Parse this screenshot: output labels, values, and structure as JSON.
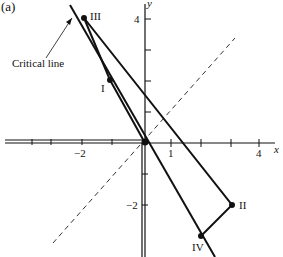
{
  "panel_label": "(a)",
  "axes": {
    "x_label": "x",
    "y_label": "y",
    "x_ticks": [
      {
        "v": -2,
        "label": "−2"
      },
      {
        "v": 1,
        "label": "1"
      },
      {
        "v": 4,
        "label": "4"
      }
    ],
    "y_ticks": [
      {
        "v": 4,
        "label": "4"
      },
      {
        "v": -2,
        "label": "−2"
      }
    ]
  },
  "annotation": "Critical line",
  "points": [
    {
      "name": "I",
      "label": "I"
    },
    {
      "name": "II",
      "label": "II"
    },
    {
      "name": "III",
      "label": "III"
    },
    {
      "name": "IV",
      "label": "IV"
    }
  ]
}
